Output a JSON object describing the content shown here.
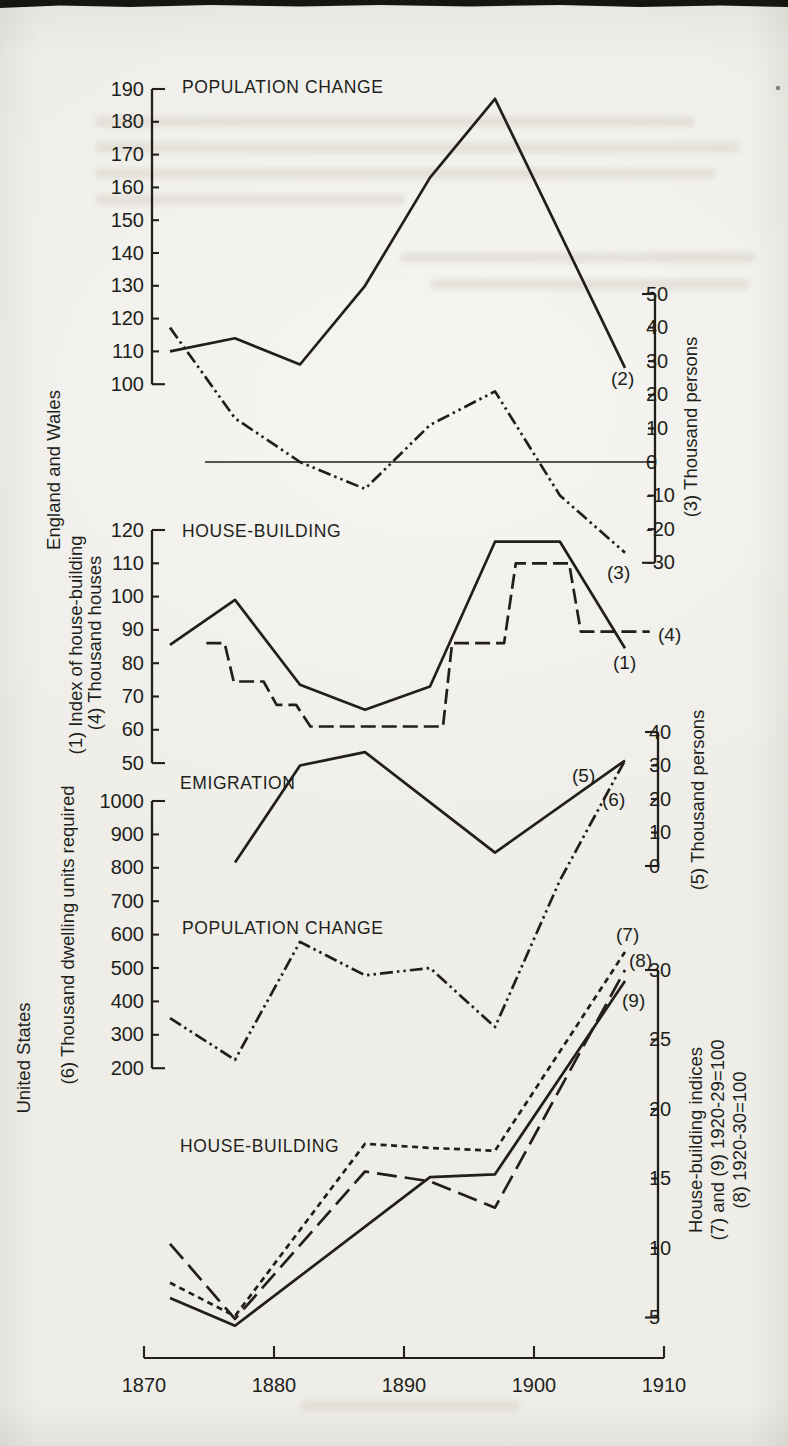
{
  "page": {
    "paper_color": "#eeede8",
    "ink_color": "#221f1b"
  },
  "x_axis": {
    "ticks": [
      1870,
      1880,
      1890,
      1900,
      1910
    ],
    "range": [
      1870,
      1910
    ],
    "layout": {
      "x0": 144,
      "px_per_year": 13.0,
      "y": 1358,
      "tick_len": 12,
      "label_y": 1392
    }
  },
  "section_labels": [
    {
      "text": "England and Wales",
      "x": 60,
      "cy": 470
    },
    {
      "text": "(1) Index of house-building",
      "x": 82,
      "cy": 645
    },
    {
      "text": "(4) Thousand houses",
      "x": 101,
      "cy": 643
    },
    {
      "text": "United States",
      "x": 30,
      "cy": 1058
    },
    {
      "text": "(6) Thousand dwelling units required",
      "x": 74,
      "cy": 935
    },
    {
      "text": "(3) Thousand persons",
      "x": 697,
      "cy": 427
    },
    {
      "text": "(5) Thousand persons",
      "x": 704,
      "cy": 800
    },
    {
      "text": "House-building indices",
      "x": 702,
      "cy": 1140
    },
    {
      "text": "(7) and (9) 1920-29=100",
      "x": 724,
      "cy": 1140
    },
    {
      "text": "(8) 1920-30=100",
      "x": 746,
      "cy": 1140
    }
  ],
  "chart_data": [
    {
      "type": "line",
      "id": "ew-population-change",
      "region": "England and Wales",
      "title": "POPULATION CHANGE",
      "title_pos": [
        182,
        93
      ],
      "left_axis": {
        "label": "(2) Thousand persons",
        "ticks": [
          190,
          180,
          170,
          160,
          150,
          140,
          130,
          120,
          110,
          100
        ],
        "x": 152,
        "v_top": 190,
        "y_top": 89,
        "px_per_unit": 3.28
      },
      "right_axis": {
        "label": "(3) Thousand persons",
        "ticks": [
          50,
          40,
          30,
          20,
          10,
          0,
          -10,
          -20,
          -30
        ],
        "x": 655,
        "v_top": 50,
        "y_top": 294,
        "px_per_unit": 3.36
      },
      "zero_line": {
        "axis": "right",
        "value": 0,
        "x_from": 205,
        "x_to": 655
      },
      "series": [
        {
          "name": "(2)",
          "style": "solid",
          "axis": "left",
          "label_pos": [
            611,
            385
          ],
          "points": [
            [
              1872,
              110
            ],
            [
              1877,
              114
            ],
            [
              1882,
              106
            ],
            [
              1887,
              130
            ],
            [
              1892,
              163
            ],
            [
              1897,
              187
            ],
            [
              1907,
              105
            ]
          ]
        },
        {
          "name": "(3)",
          "style": "dashdotdot",
          "axis": "right",
          "label_pos": [
            607,
            579
          ],
          "points": [
            [
              1872,
              40
            ],
            [
              1877,
              13
            ],
            [
              1882,
              0
            ],
            [
              1887,
              -8
            ],
            [
              1892,
              11
            ],
            [
              1897,
              21
            ],
            [
              1902,
              -10
            ],
            [
              1907,
              -27
            ]
          ]
        }
      ]
    },
    {
      "type": "line",
      "id": "ew-house-building",
      "region": "England and Wales",
      "title": "HOUSE-BUILDING",
      "title_pos": [
        182,
        537
      ],
      "left_axis": {
        "label": "(1) Index of house-building / (4) Thousand houses",
        "ticks": [
          120,
          110,
          100,
          90,
          80,
          70,
          60,
          50
        ],
        "x": 152,
        "v_top": 120,
        "y_top": 530,
        "px_per_unit": 3.33
      },
      "series": [
        {
          "name": "(1)",
          "style": "solid",
          "axis": "left",
          "label_pos": [
            613,
            669
          ],
          "points": [
            [
              1872,
              85.5
            ],
            [
              1877,
              99
            ],
            [
              1882,
              73.5
            ],
            [
              1887,
              66
            ],
            [
              1892,
              73
            ],
            [
              1897,
              116.5
            ],
            [
              1902,
              116.5
            ],
            [
              1907,
              84.5
            ]
          ]
        },
        {
          "name": "(4)",
          "style": "dash",
          "axis": "left",
          "label_pos": [
            658,
            641
          ],
          "points": [
            [
              1874.8,
              86
            ],
            [
              1876.2,
              86
            ],
            [
              1876.9,
              74.5
            ],
            [
              1879.2,
              74.5
            ],
            [
              1880.2,
              67.5
            ],
            [
              1881.7,
              67.5
            ],
            [
              1882.8,
              61
            ],
            [
              1893,
              61
            ],
            [
              1893.7,
              86
            ],
            [
              1897.7,
              86
            ],
            [
              1898.6,
              110
            ],
            [
              1902.7,
              110
            ],
            [
              1903.6,
              89.5
            ],
            [
              1908.9,
              89.5
            ]
          ]
        }
      ]
    },
    {
      "type": "line",
      "id": "ew-emigration",
      "region": "England and Wales",
      "title": "EMIGRATION",
      "title_pos": [
        180,
        789
      ],
      "right_axis": {
        "label": "(5) Thousand persons",
        "ticks": [
          40,
          30,
          20,
          10,
          0
        ],
        "x": 658,
        "v_top": 40,
        "y_top": 732,
        "px_per_unit": 3.35
      },
      "series": [
        {
          "name": "(5)",
          "style": "solid",
          "axis": "right",
          "label_pos": [
            572,
            782
          ],
          "points": [
            [
              1877,
              1
            ],
            [
              1882,
              30
            ],
            [
              1887,
              34
            ],
            [
              1897,
              4
            ],
            [
              1907,
              31.5
            ]
          ]
        }
      ]
    },
    {
      "type": "line",
      "id": "us-population-change",
      "region": "United States",
      "title": "POPULATION CHANGE",
      "title_pos": [
        182,
        934
      ],
      "left_axis": {
        "label": "(6) Thousand dwelling units required",
        "ticks": [
          1000,
          900,
          800,
          700,
          600,
          500,
          400,
          300,
          200
        ],
        "x": 152,
        "v_top": 1000,
        "y_top": 801,
        "px_per_unit": 0.334
      },
      "series": [
        {
          "name": "(6)",
          "style": "dashdotdot",
          "axis": "left",
          "label_pos": [
            602,
            806
          ],
          "points": [
            [
              1872,
              350
            ],
            [
              1877,
              225
            ],
            [
              1882,
              578
            ],
            [
              1887,
              478
            ],
            [
              1892,
              500
            ],
            [
              1897,
              323
            ],
            [
              1902,
              763
            ],
            [
              1907,
              1122
            ]
          ]
        }
      ]
    },
    {
      "type": "line",
      "id": "us-house-building",
      "region": "United States",
      "title": "HOUSE-BUILDING",
      "title_pos": [
        180,
        1152
      ],
      "right_axis": {
        "label": "House-building indices; (7) and (9) 1920-29=100; (8) 1920-30=100",
        "ticks": [
          30,
          25,
          20,
          15,
          10,
          5
        ],
        "x": 658,
        "v_top": 30,
        "y_top": 970,
        "px_per_unit": 13.9
      },
      "series": [
        {
          "name": "(7)",
          "style": "shortdash",
          "axis": "right",
          "label_pos": [
            616,
            941
          ],
          "points": [
            [
              1872,
              7.5
            ],
            [
              1877,
              5.1
            ],
            [
              1887,
              17.5
            ],
            [
              1892,
              17.2
            ],
            [
              1897,
              17
            ],
            [
              1907,
              31.3
            ]
          ]
        },
        {
          "name": "(8)",
          "style": "longdash",
          "axis": "right",
          "label_pos": [
            629,
            967
          ],
          "points": [
            [
              1872,
              10.3
            ],
            [
              1877,
              4.9
            ],
            [
              1887,
              15.5
            ],
            [
              1892,
              14.8
            ],
            [
              1897,
              12.9
            ],
            [
              1907,
              30
            ]
          ]
        },
        {
          "name": "(9)",
          "style": "solid",
          "axis": "right",
          "label_pos": [
            622,
            1007
          ],
          "points": [
            [
              1872,
              6.4
            ],
            [
              1877,
              4.4
            ],
            [
              1892,
              15.1
            ],
            [
              1897,
              15.3
            ],
            [
              1907,
              29.2
            ]
          ]
        }
      ]
    }
  ]
}
